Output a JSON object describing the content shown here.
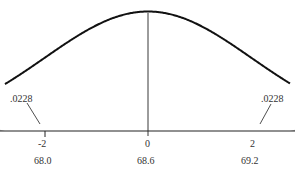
{
  "chart_data": {
    "type": "area",
    "title": "",
    "distribution": "normal",
    "z_ticks": [
      "-2",
      "0",
      "2"
    ],
    "value_ticks": [
      "68.0",
      "68.6",
      "69.2"
    ],
    "x_z": [
      -2,
      0,
      2
    ],
    "x_values": [
      68.0,
      68.6,
      69.2
    ],
    "mean": 68.6,
    "sd": 0.3,
    "shaded_regions": [
      {
        "side": "left",
        "from_z": null,
        "to_z": -2,
        "area_label": ".0228"
      },
      {
        "side": "right",
        "from_z": 2,
        "to_z": null,
        "area_label": ".0228"
      }
    ],
    "xlabel": "",
    "ylabel": "",
    "grid": false,
    "legend": null
  },
  "labels": {
    "left_area": ".0228",
    "right_area": ".0228",
    "z_left": "-2",
    "z_center": "0",
    "z_right": "2",
    "val_left": "68.0",
    "val_center": "68.6",
    "val_right": "69.2"
  },
  "colors": {
    "curve": "#111111",
    "shade": "#b5b5b5",
    "axis": "#222222"
  }
}
